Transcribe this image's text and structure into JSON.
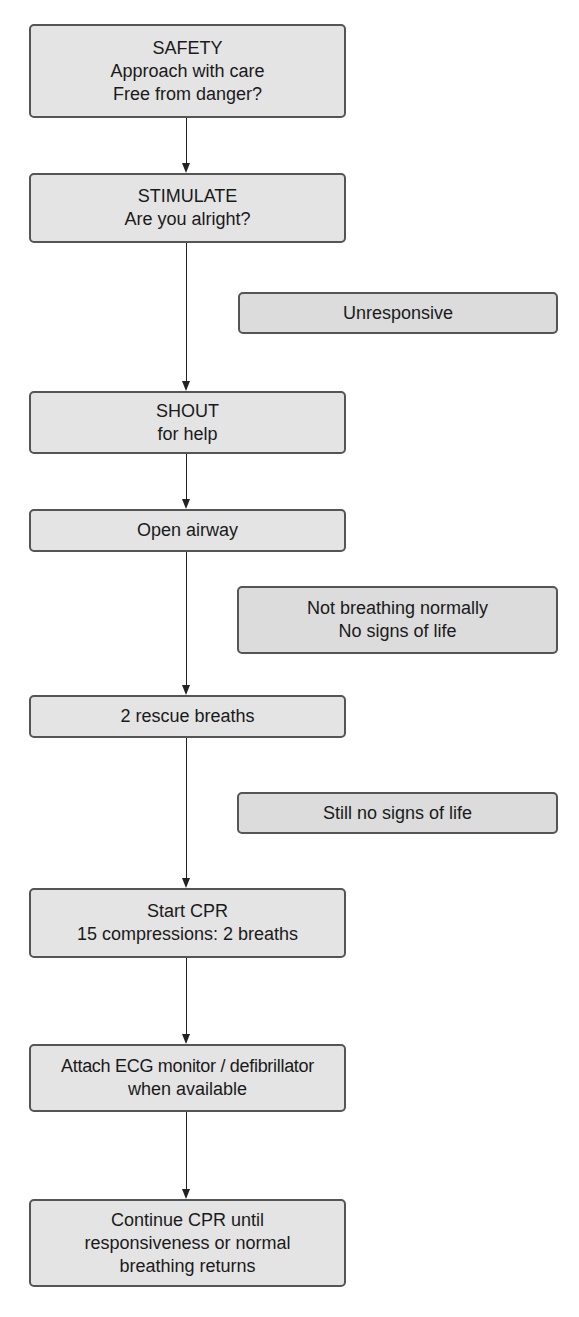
{
  "flowchart": {
    "main_steps": [
      {
        "id": "safety",
        "lines": [
          "SAFETY",
          "Approach with care",
          "Free from danger?"
        ]
      },
      {
        "id": "stimulate",
        "lines": [
          "STIMULATE",
          "Are you alright?"
        ]
      },
      {
        "id": "shout",
        "lines": [
          "SHOUT",
          "for help"
        ]
      },
      {
        "id": "open-airway",
        "lines": [
          "Open airway"
        ]
      },
      {
        "id": "rescue-breaths",
        "lines": [
          "2 rescue breaths"
        ]
      },
      {
        "id": "start-cpr",
        "lines": [
          "Start CPR",
          "15 compressions: 2 breaths"
        ]
      },
      {
        "id": "attach-ecg",
        "lines": [
          "Attach ECG monitor / defibrillator",
          "when available"
        ]
      },
      {
        "id": "continue-cpr",
        "lines": [
          "Continue CPR until",
          "responsiveness or normal",
          "breathing returns"
        ]
      }
    ],
    "conditions": [
      {
        "id": "unresponsive",
        "lines": [
          "Unresponsive"
        ]
      },
      {
        "id": "not-breathing",
        "lines": [
          "Not breathing normally",
          "No signs of life"
        ]
      },
      {
        "id": "still-no-signs",
        "lines": [
          "Still no signs of life"
        ]
      }
    ],
    "colors": {
      "box_fill": "#e4e4e4",
      "box_border": "#555555",
      "arrow": "#222222",
      "background": "#ffffff"
    }
  }
}
